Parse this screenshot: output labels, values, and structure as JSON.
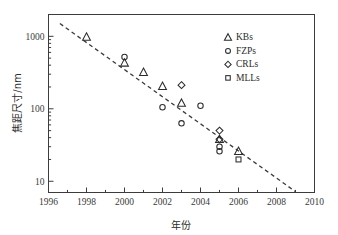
{
  "chart_data": {
    "type": "scatter",
    "title": "",
    "xlabel": "年份",
    "ylabel": "焦距尺寸/nm",
    "xlim": [
      1996,
      2010
    ],
    "ylim": [
      7,
      2000
    ],
    "yscale": "log",
    "grid": false,
    "legend_position": "top-right",
    "xticks": [
      1996,
      1998,
      2000,
      2002,
      2004,
      2006,
      2008,
      2010
    ],
    "xtick_labels": [
      "1996",
      "1998",
      "2000",
      "2002",
      "2004",
      "2006",
      "2008",
      "2010"
    ],
    "yticks": [
      10,
      100,
      1000
    ],
    "ytick_labels": [
      "10",
      "100",
      "1000"
    ],
    "series": [
      {
        "name": "KBs",
        "marker": "triangle",
        "points": [
          {
            "x": 1998.0,
            "y": 980
          },
          {
            "x": 2000.0,
            "y": 430
          },
          {
            "x": 2001.0,
            "y": 320
          },
          {
            "x": 2002.0,
            "y": 205
          },
          {
            "x": 2003.0,
            "y": 120
          },
          {
            "x": 2005.0,
            "y": 38
          },
          {
            "x": 2006.0,
            "y": 26
          }
        ]
      },
      {
        "name": "FZPs",
        "marker": "circle",
        "points": [
          {
            "x": 2000.0,
            "y": 520
          },
          {
            "x": 2002.0,
            "y": 105
          },
          {
            "x": 2003.0,
            "y": 63
          },
          {
            "x": 2004.0,
            "y": 110
          },
          {
            "x": 2005.0,
            "y": 30
          },
          {
            "x": 2005.0,
            "y": 26
          }
        ]
      },
      {
        "name": "CRLs",
        "marker": "diamond",
        "points": [
          {
            "x": 2003.0,
            "y": 212
          },
          {
            "x": 2005.0,
            "y": 50
          },
          {
            "x": 2005.0,
            "y": 38
          }
        ]
      },
      {
        "name": "MLLs",
        "marker": "square",
        "points": [
          {
            "x": 2006.0,
            "y": 20
          }
        ]
      }
    ],
    "trendline": {
      "name": "trend",
      "style": "dashed",
      "start": {
        "x": 1996.6,
        "y": 1500
      },
      "end": {
        "x": 2009.0,
        "y": 7.2
      }
    }
  },
  "legend": {
    "entries": [
      {
        "label": "KBs",
        "marker": "triangle"
      },
      {
        "label": "FZPs",
        "marker": "circle"
      },
      {
        "label": "CRLs",
        "marker": "diamond"
      },
      {
        "label": "MLLs",
        "marker": "square"
      }
    ]
  }
}
